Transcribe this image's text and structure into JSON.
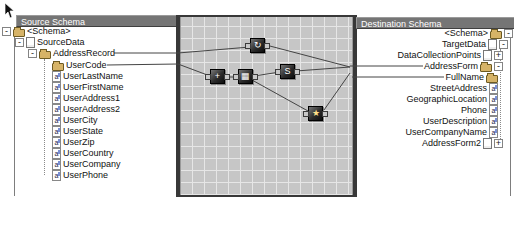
{
  "source_panel": {
    "title": "Source Schema",
    "tree": [
      {
        "label": "<Schema>",
        "depth": 0,
        "icon": "folder",
        "expand": "minus",
        "y": 31
      },
      {
        "label": "SourceData",
        "depth": 1,
        "icon": "doc",
        "expand": "minus",
        "y": 42
      },
      {
        "label": "AddressRecord",
        "depth": 2,
        "icon": "folder",
        "expand": "minus",
        "y": 53
      },
      {
        "label": "UserCode",
        "depth": 3,
        "icon": "folder",
        "y": 65
      },
      {
        "label": "UserLastName",
        "depth": 3,
        "icon": "field",
        "y": 76
      },
      {
        "label": "UserFirstName",
        "depth": 3,
        "icon": "field",
        "y": 87
      },
      {
        "label": "UserAddress1",
        "depth": 3,
        "icon": "field",
        "y": 98
      },
      {
        "label": "UserAddress2",
        "depth": 3,
        "icon": "field",
        "y": 109
      },
      {
        "label": "UserCity",
        "depth": 3,
        "icon": "field",
        "y": 120
      },
      {
        "label": "UserState",
        "depth": 3,
        "icon": "field",
        "y": 131
      },
      {
        "label": "UserZip",
        "depth": 3,
        "icon": "field",
        "y": 142
      },
      {
        "label": "UserCountry",
        "depth": 3,
        "icon": "field",
        "y": 153
      },
      {
        "label": "UserCompany",
        "depth": 3,
        "icon": "field",
        "y": 164
      },
      {
        "label": "UserPhone",
        "depth": 3,
        "icon": "field",
        "y": 175
      }
    ]
  },
  "destination_panel": {
    "title": "Destination Schema",
    "tree": [
      {
        "label": "<Schema>",
        "depth": 0,
        "icon": "folder",
        "expand": "minus",
        "y": 33
      },
      {
        "label": "TargetData",
        "depth": 1,
        "icon": "doc",
        "expand": "minus",
        "y": 44
      },
      {
        "label": "DataCollectionPoints",
        "depth": 2,
        "icon": "doc",
        "expand": "plus",
        "y": 55
      },
      {
        "label": "AddressForm",
        "depth": 2,
        "icon": "folder",
        "expand": "minus",
        "y": 66
      },
      {
        "label": "FullName",
        "depth": 3,
        "icon": "folder",
        "y": 77
      },
      {
        "label": "StreetAddress",
        "depth": 3,
        "icon": "field",
        "y": 88
      },
      {
        "label": "GeographicLocation",
        "depth": 3,
        "icon": "field",
        "y": 99
      },
      {
        "label": "Phone",
        "depth": 3,
        "icon": "field",
        "y": 110
      },
      {
        "label": "UserDescription",
        "depth": 3,
        "icon": "field",
        "y": 121
      },
      {
        "label": "UserCompanyName",
        "depth": 3,
        "icon": "field",
        "y": 132
      },
      {
        "label": "AddressForm2",
        "depth": 2,
        "icon": "doc",
        "expand": "plus",
        "y": 143
      }
    ]
  },
  "map_grid": {
    "functoids": [
      {
        "name": "looping-functoid",
        "glyph": "↻",
        "x": 258,
        "y": 46
      },
      {
        "name": "functoid-1",
        "glyph": "+",
        "x": 218,
        "y": 77
      },
      {
        "name": "functoid-2",
        "glyph": "▦",
        "x": 246,
        "y": 77
      },
      {
        "name": "script-functoid",
        "glyph": "S",
        "x": 288,
        "y": 72
      },
      {
        "name": "value-functoid",
        "glyph": "★",
        "x": 316,
        "y": 114
      }
    ],
    "links": [
      [
        114,
        53,
        178,
        53
      ],
      [
        178,
        53,
        250,
        47
      ],
      [
        107,
        65,
        178,
        64
      ],
      [
        178,
        64,
        210,
        76
      ],
      [
        226,
        77,
        238,
        77
      ],
      [
        254,
        76,
        280,
        72
      ],
      [
        252,
        80,
        308,
        111
      ],
      [
        296,
        71,
        350,
        67
      ],
      [
        266,
        45,
        350,
        67
      ],
      [
        324,
        110,
        350,
        73
      ],
      [
        350,
        66,
        423,
        66
      ],
      [
        352,
        77,
        444,
        77
      ]
    ]
  },
  "expand_glyphs": {
    "minus": "-",
    "plus": "+"
  },
  "colors": {
    "header_bg": "#757575",
    "grid_bg": "#c6c6c6",
    "link": "#444444",
    "folder": "#d6b367"
  }
}
